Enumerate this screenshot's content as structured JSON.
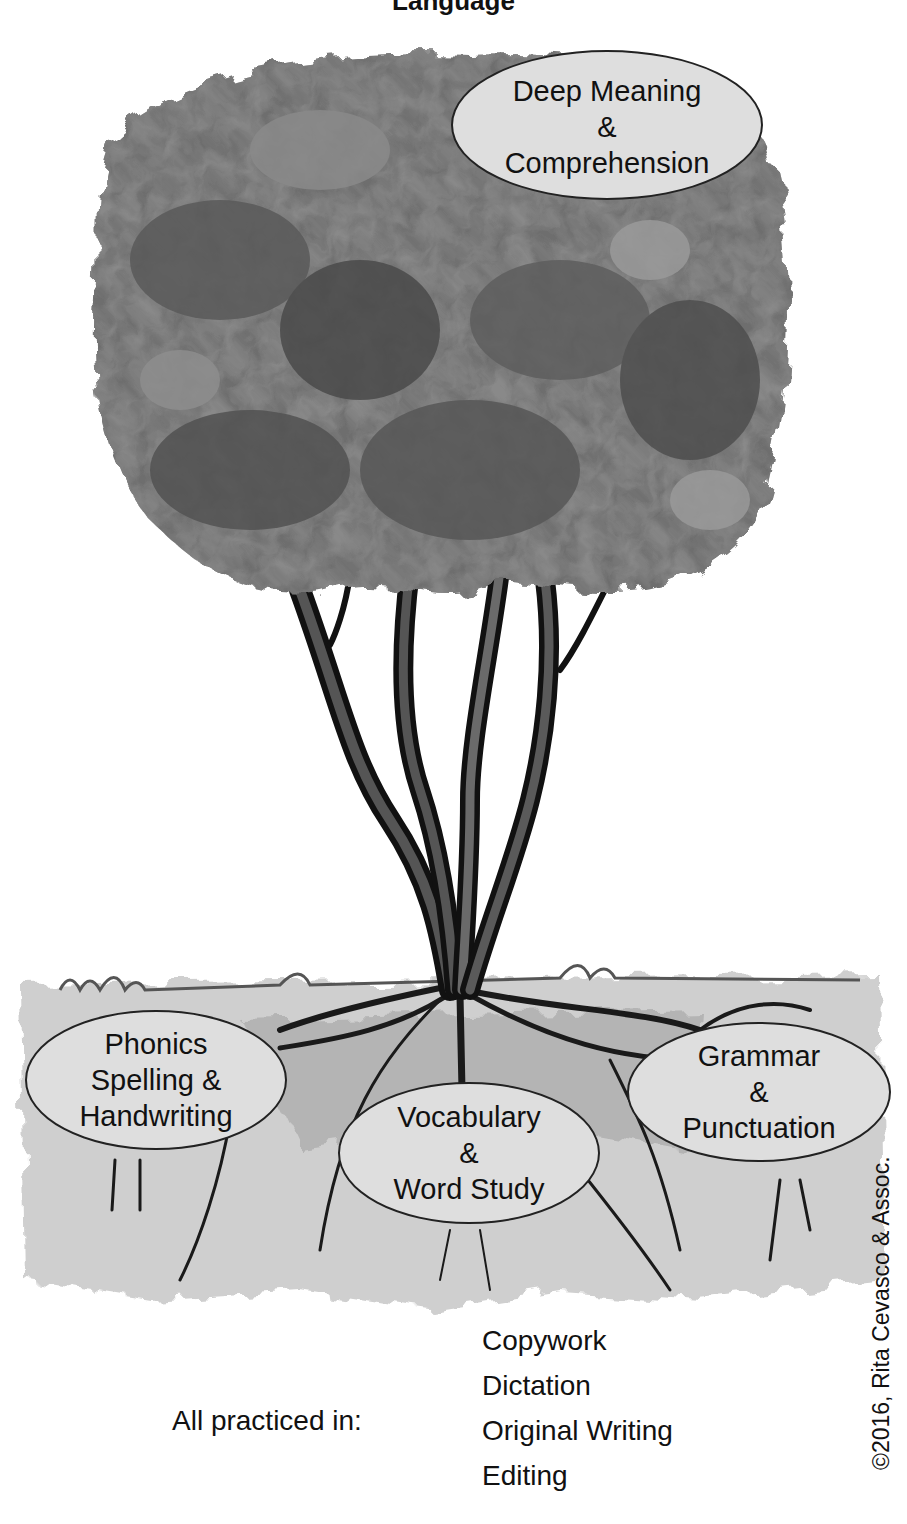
{
  "title_fragment": "Language",
  "canopy": {
    "label_lines": [
      "Deep Meaning",
      "&",
      "Comprehension"
    ]
  },
  "roots": [
    {
      "id": "phonics",
      "label_lines": [
        "Phonics",
        "Spelling &",
        "Handwriting"
      ]
    },
    {
      "id": "vocabulary",
      "label_lines": [
        "Vocabulary",
        "&",
        "Word Study"
      ]
    },
    {
      "id": "grammar",
      "label_lines": [
        "Grammar",
        "&",
        "Punctuation"
      ]
    }
  ],
  "practice": {
    "label": "All practiced in:",
    "items": [
      "Copywork",
      "Dictation",
      "Original Writing",
      "Editing"
    ]
  },
  "copyright": "©2016, Rita Cevasco & Assoc.",
  "colors": {
    "canopy_dark": "#3a3a3a",
    "canopy_mid": "#6e6e6e",
    "canopy_light": "#a8a8a8",
    "bubble_fill": "#dedede",
    "ground": "#c8c8c8",
    "trunk": "#1a1a1a"
  }
}
